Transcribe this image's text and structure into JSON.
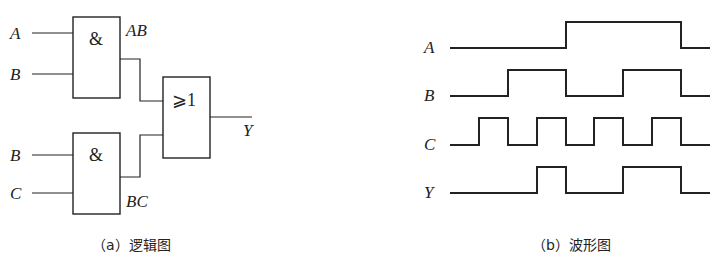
{
  "logic_diagram": {
    "inputs": {
      "and1_a": "A",
      "and1_b": "B",
      "and2_b": "B",
      "and2_c": "C"
    },
    "gates": {
      "and1": {
        "symbol": "&",
        "output_label": "AB"
      },
      "and2": {
        "symbol": "&",
        "output_label": "BC"
      },
      "or": {
        "symbol": "⩾1"
      }
    },
    "output": "Y",
    "caption": "（a）逻辑图"
  },
  "waveform": {
    "signals": [
      {
        "name": "A",
        "levels": [
          0,
          0,
          0,
          0,
          1,
          1,
          1,
          1,
          0
        ]
      },
      {
        "name": "B",
        "levels": [
          0,
          0,
          1,
          1,
          0,
          0,
          1,
          1,
          0
        ]
      },
      {
        "name": "C",
        "levels": [
          0,
          1,
          0,
          1,
          0,
          1,
          0,
          1,
          0
        ]
      },
      {
        "name": "Y",
        "levels": [
          0,
          0,
          0,
          1,
          0,
          0,
          1,
          1,
          0
        ]
      }
    ],
    "caption": "（b）波形图"
  }
}
